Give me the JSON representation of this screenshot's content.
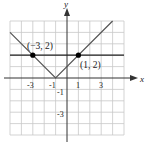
{
  "diagram": {
    "type": "coordinate-graph",
    "functions": [
      "y = |x + 1|",
      "y = 2"
    ],
    "axes": {
      "x_label": "x",
      "y_label": "y",
      "x_ticks": [
        "-3",
        "-1",
        "1",
        "3"
      ],
      "y_ticks": [
        "-1",
        "-3"
      ],
      "x_range": [
        -5,
        5
      ],
      "y_range": [
        -5,
        5
      ]
    },
    "points": [
      {
        "label": "(−3, 2)",
        "x": -3,
        "y": 2
      },
      {
        "label": "(1, 2)",
        "x": 1,
        "y": 2
      }
    ],
    "colors": {
      "grid": "#c8c8c8",
      "axis": "#333333",
      "v_line": "#555555",
      "h_line": "#222222",
      "point": "#000000"
    }
  }
}
